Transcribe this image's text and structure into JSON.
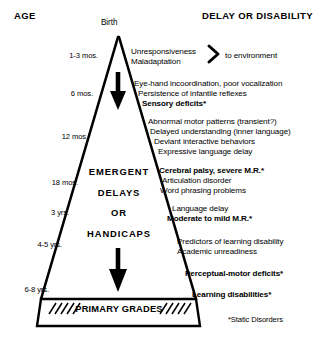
{
  "headers": {
    "left": "AGE",
    "right": "DELAY OR DISABILITY"
  },
  "apex_label": "Birth",
  "age_labels": [
    {
      "text": "1-3 mos.",
      "y": 52
    },
    {
      "text": "6 mos.",
      "y": 90
    },
    {
      "text": "12 mos.",
      "y": 133
    },
    {
      "text": "18 mos.",
      "y": 179
    },
    {
      "text": "3 yrs.",
      "y": 209
    },
    {
      "text": "4-5 yrs.",
      "y": 241
    },
    {
      "text": "6-8 yrs.",
      "y": 286
    }
  ],
  "pyramid_words": [
    {
      "text": "EMERGENT",
      "y": 167
    },
    {
      "text": "DELAYS",
      "y": 188
    },
    {
      "text": "OR",
      "y": 208
    },
    {
      "text": "HANDICAPS",
      "y": 229
    }
  ],
  "primary_grades": "PRIMARY GRADES",
  "brace_symbol": ">",
  "brace_tail": "to environment",
  "right_groups": [
    {
      "lines": [
        {
          "text": "Unresponsiveness",
          "bold": false,
          "x": 131,
          "y": 48
        },
        {
          "text": "Maladaptation",
          "bold": false,
          "x": 131,
          "y": 58
        }
      ]
    },
    {
      "lines": [
        {
          "text": "Eye-hand incoordination, poor vocalization",
          "bold": false,
          "x": 134,
          "y": 80
        },
        {
          "text": "Persistence of infantile reflexes",
          "bold": false,
          "x": 138,
          "y": 90
        },
        {
          "text": "Sensory deficits*",
          "bold": true,
          "x": 142,
          "y": 100
        }
      ]
    },
    {
      "lines": [
        {
          "text": "Abnormal motor patterns (transient?)",
          "bold": false,
          "x": 148,
          "y": 118
        },
        {
          "text": "Delayed understanding (inner language)",
          "bold": false,
          "x": 150,
          "y": 128
        },
        {
          "text": "Deviant interactive behaviors",
          "bold": false,
          "x": 154,
          "y": 138
        },
        {
          "text": "Expressive language delay",
          "bold": false,
          "x": 158,
          "y": 148
        }
      ]
    },
    {
      "lines": [
        {
          "text": "Cerebral palsy, severe M.R.*",
          "bold": true,
          "x": 159,
          "y": 167
        },
        {
          "text": "Articulation disorder",
          "bold": false,
          "x": 162,
          "y": 177
        },
        {
          "text": "Word phrasing problems",
          "bold": false,
          "x": 160,
          "y": 187
        }
      ]
    },
    {
      "lines": [
        {
          "text": "Language delay",
          "bold": false,
          "x": 172,
          "y": 205
        },
        {
          "text": "Moderate to mild M.R.*",
          "bold": true,
          "x": 167,
          "y": 215
        }
      ]
    },
    {
      "lines": [
        {
          "text": "Predictors of learning disability",
          "bold": false,
          "x": 177,
          "y": 238
        },
        {
          "text": "Academic unreadiness",
          "bold": false,
          "x": 177,
          "y": 248
        }
      ]
    },
    {
      "lines": [
        {
          "text": "Perceptual-motor deficits*",
          "bold": true,
          "x": 185,
          "y": 270
        }
      ]
    },
    {
      "lines": [
        {
          "text": "Learning disabilities*",
          "bold": true,
          "x": 192,
          "y": 291
        }
      ]
    }
  ],
  "footnote": "*Static Disorders",
  "colors": {
    "ink": "#000000",
    "background": "#ffffff"
  }
}
